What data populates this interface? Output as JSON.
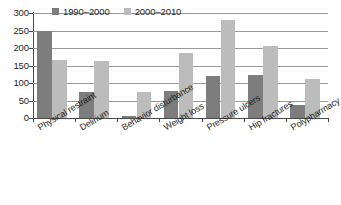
{
  "chart_data": {
    "type": "bar",
    "title": "",
    "subtitle": "",
    "xlabel": "",
    "ylabel": "",
    "ylim": [
      0,
      300
    ],
    "yticks": [
      0,
      50,
      100,
      150,
      200,
      250,
      300
    ],
    "ytick_labels": [
      "0",
      "50",
      "100",
      "150",
      "200",
      "250",
      "300"
    ],
    "grid": true,
    "legend_position": "top-left-inside",
    "categories": [
      "Physical restraint",
      "Delirium",
      "Behavior disturbance",
      "Weight loss",
      "Pressure ulcers",
      "Hip fractures",
      "Polypharmacy"
    ],
    "series": [
      {
        "name": "1990–2000",
        "color": "#7d7d7d",
        "values": [
          248,
          73,
          5,
          77,
          121,
          123,
          36
        ]
      },
      {
        "name": "2000–2010",
        "color": "#bcbcbc",
        "values": [
          165,
          162,
          74,
          185,
          280,
          207,
          112
        ]
      }
    ]
  },
  "colors": {
    "series_1990_2000": "#7d7d7d",
    "series_2000_2010": "#bcbcbc",
    "axis": "#4a4a4a",
    "gridline": "#9a9a9a",
    "background": "#ffffff",
    "text": "#1f1f1f"
  }
}
